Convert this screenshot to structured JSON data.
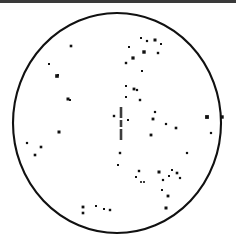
{
  "figure": {
    "type": "scatter-field",
    "title": "",
    "width": 236,
    "height": 246,
    "background_color": "#ffffff",
    "ink_color": "#111111"
  },
  "top_border": {
    "label": "page-edge-strip",
    "color": "#3a3a3a",
    "height_px": 3
  },
  "field_outline": {
    "label": "circular field of view",
    "shape": "ellipse",
    "center_x": 117,
    "center_y": 123,
    "radius_x": 104,
    "radius_y": 110,
    "stroke_color": "#111111",
    "stroke_width": 2.1,
    "fill": "none"
  },
  "center_marker": {
    "label": "central vertical bar marker",
    "orientation": "vertical",
    "x": 121,
    "color": "#3d3d3d",
    "width_px": 2.6,
    "segments": [
      {
        "y_top": 107,
        "y_bottom": 118
      },
      {
        "y_top": 120,
        "y_bottom": 127
      },
      {
        "y_top": 129,
        "y_bottom": 140
      }
    ]
  },
  "chart_data": {
    "type": "scatter",
    "title": "",
    "xlabel": "",
    "ylabel": "",
    "xlim": [
      0,
      236
    ],
    "ylim": [
      0,
      246
    ],
    "grid": false,
    "legend": "none",
    "marker_shape": "square",
    "marker_color": "#111111",
    "point_count": 56,
    "points": [
      {
        "x": 71,
        "y": 46,
        "r": 1.3
      },
      {
        "x": 49,
        "y": 64,
        "r": 1.0
      },
      {
        "x": 57,
        "y": 76,
        "r": 1.8
      },
      {
        "x": 68,
        "y": 99,
        "r": 1.5
      },
      {
        "x": 70,
        "y": 100,
        "r": 1.0
      },
      {
        "x": 27,
        "y": 143,
        "r": 1.1
      },
      {
        "x": 41,
        "y": 147,
        "r": 1.3
      },
      {
        "x": 59,
        "y": 132,
        "r": 1.5
      },
      {
        "x": 35,
        "y": 155,
        "r": 1.3
      },
      {
        "x": 83,
        "y": 207,
        "r": 1.4
      },
      {
        "x": 83,
        "y": 213,
        "r": 1.3
      },
      {
        "x": 96,
        "y": 206,
        "r": 1.0
      },
      {
        "x": 104,
        "y": 209,
        "r": 1.0
      },
      {
        "x": 110,
        "y": 210,
        "r": 1.2
      },
      {
        "x": 166,
        "y": 208,
        "r": 1.5
      },
      {
        "x": 126,
        "y": 63,
        "r": 1.2
      },
      {
        "x": 129,
        "y": 47,
        "r": 1.0
      },
      {
        "x": 133,
        "y": 58,
        "r": 1.6
      },
      {
        "x": 141,
        "y": 38,
        "r": 1.0
      },
      {
        "x": 144,
        "y": 52,
        "r": 1.7
      },
      {
        "x": 147,
        "y": 41,
        "r": 1.1
      },
      {
        "x": 155,
        "y": 40,
        "r": 1.5
      },
      {
        "x": 158,
        "y": 53,
        "r": 1.2
      },
      {
        "x": 161,
        "y": 44,
        "r": 1.0
      },
      {
        "x": 142,
        "y": 71,
        "r": 1.0
      },
      {
        "x": 126,
        "y": 86,
        "r": 1.0
      },
      {
        "x": 134,
        "y": 89,
        "r": 1.4
      },
      {
        "x": 137,
        "y": 90,
        "r": 1.1
      },
      {
        "x": 140,
        "y": 100,
        "r": 1.2
      },
      {
        "x": 126,
        "y": 97,
        "r": 1.0
      },
      {
        "x": 114,
        "y": 116,
        "r": 1.2
      },
      {
        "x": 153,
        "y": 119,
        "r": 1.4
      },
      {
        "x": 166,
        "y": 124,
        "r": 1.1
      },
      {
        "x": 151,
        "y": 135,
        "r": 1.4
      },
      {
        "x": 176,
        "y": 128,
        "r": 1.3
      },
      {
        "x": 207,
        "y": 117,
        "r": 1.9
      },
      {
        "x": 222,
        "y": 117,
        "r": 1.7
      },
      {
        "x": 211,
        "y": 133,
        "r": 1.1
      },
      {
        "x": 128,
        "y": 120,
        "r": 1.0
      },
      {
        "x": 139,
        "y": 171,
        "r": 1.2
      },
      {
        "x": 136,
        "y": 177,
        "r": 1.0
      },
      {
        "x": 141,
        "y": 182,
        "r": 0.9
      },
      {
        "x": 144,
        "y": 182,
        "r": 0.9
      },
      {
        "x": 159,
        "y": 172,
        "r": 1.5
      },
      {
        "x": 163,
        "y": 180,
        "r": 1.1
      },
      {
        "x": 169,
        "y": 176,
        "r": 1.0
      },
      {
        "x": 172,
        "y": 170,
        "r": 1.0
      },
      {
        "x": 177,
        "y": 173,
        "r": 1.3
      },
      {
        "x": 180,
        "y": 178,
        "r": 1.1
      },
      {
        "x": 162,
        "y": 190,
        "r": 1.0
      },
      {
        "x": 168,
        "y": 196,
        "r": 1.4
      },
      {
        "x": 187,
        "y": 153,
        "r": 1.1
      },
      {
        "x": 118,
        "y": 165,
        "r": 1.0
      },
      {
        "x": 120,
        "y": 153,
        "r": 1.2
      },
      {
        "x": 155,
        "y": 112,
        "r": 1.1
      },
      {
        "x": 58,
        "y": 75,
        "r": 1.0
      }
    ]
  }
}
